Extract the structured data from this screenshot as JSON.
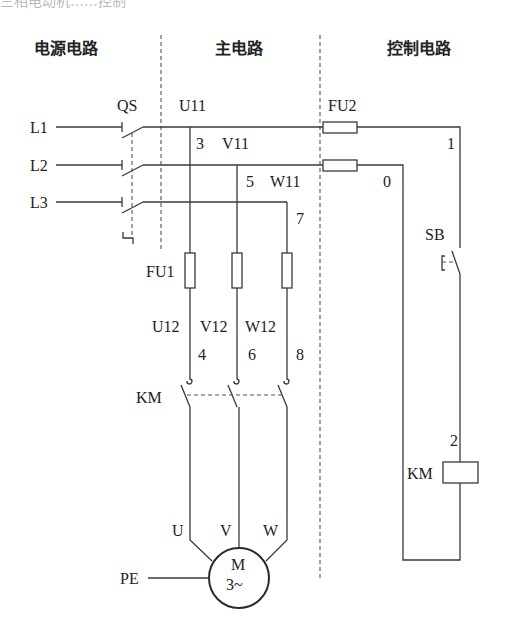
{
  "cropped_top_text": "三相电动机……控制",
  "headers": {
    "power": "电源电路",
    "main": "主电路",
    "control": "控制电路"
  },
  "power_section": {
    "lines": [
      "L1",
      "L2",
      "L3"
    ],
    "switch_label": "QS"
  },
  "main_section": {
    "node_labels": [
      "U11",
      "3",
      "V11",
      "5",
      "W11",
      "7"
    ],
    "fuse_label": "FU1",
    "after_fuse_labels": [
      "U12",
      "V12",
      "W12"
    ],
    "node_after_fuse": [
      "4",
      "6",
      "8"
    ],
    "contactor_label": "KM",
    "motor_terminals": [
      "U",
      "V",
      "W"
    ],
    "motor_label": "M",
    "motor_phase": "3~",
    "ground_label": "PE"
  },
  "control_section": {
    "fuse_label": "FU2",
    "node_labels": [
      "1",
      "0",
      "2"
    ],
    "button_label": "SB",
    "coil_label": "KM"
  },
  "colors": {
    "line": "#3a3a3a",
    "background": "#ffffff"
  }
}
